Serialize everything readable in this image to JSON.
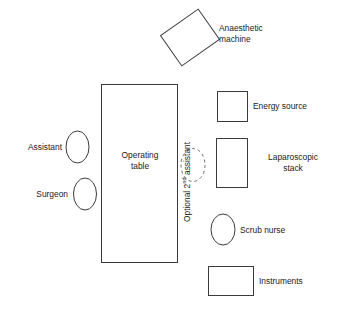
{
  "diagram": {
    "canvas": {
      "width": 338,
      "height": 310
    },
    "stroke_color": "#3b3b3b",
    "dashed_stroke_color": "#6d6d6d",
    "fill_color": "#ffffff",
    "background_color": "#ffffff",
    "elements": {
      "anaesthetic_machine": {
        "label": "Anaesthetic\nmachine",
        "shape": "rotated-rectangle",
        "rotation_deg": -35
      },
      "energy_source": {
        "label": "Energy source",
        "shape": "rectangle"
      },
      "laparoscopic_stack": {
        "label": "Laparoscopic\nstack",
        "shape": "rectangle"
      },
      "scrub_nurse": {
        "label": "Scrub nurse",
        "shape": "ellipse"
      },
      "instruments": {
        "label": "Instruments",
        "shape": "rectangle"
      },
      "operating_table": {
        "label": "Operating\ntable",
        "shape": "rectangle"
      },
      "assistant": {
        "label": "Assistant",
        "shape": "ellipse"
      },
      "surgeon": {
        "label": "Surgeon",
        "shape": "ellipse"
      },
      "optional_second_assistant": {
        "label_prefix": "Optional 2",
        "label_superscript": "nd",
        "label_suffix": " assistant",
        "shape": "dashed-ellipse",
        "orientation": "vertical-bottom-to-top"
      }
    }
  }
}
